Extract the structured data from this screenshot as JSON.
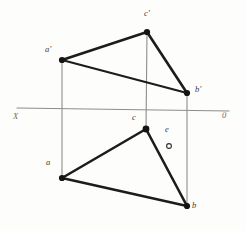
{
  "figure": {
    "background_color": "#fdfdfc",
    "ground_line": {
      "left_label": "X",
      "right_label": "0",
      "color": "#8d8d8b"
    },
    "stroke_colors": {
      "triangle_edge": "#1c1c1c",
      "projector": "#8d8d8b",
      "vertex_fill": "#141414",
      "label_text": "#3b3b3b"
    },
    "vertices": [
      {
        "id": "a-prime",
        "label": "a'",
        "x": 62,
        "y": 60,
        "view": "front",
        "marker": "filled"
      },
      {
        "id": "c-prime",
        "label": "c'",
        "x": 147,
        "y": 32,
        "view": "front",
        "marker": "filled"
      },
      {
        "id": "b-prime",
        "label": "b'",
        "x": 187,
        "y": 93,
        "view": "front",
        "marker": "filled"
      },
      {
        "id": "a",
        "label": "a",
        "x": 62,
        "y": 178,
        "view": "top",
        "marker": "filled"
      },
      {
        "id": "c",
        "label": "c",
        "x": 146,
        "y": 129,
        "view": "top",
        "marker": "filled"
      },
      {
        "id": "b",
        "label": "b",
        "x": 187,
        "y": 206,
        "view": "top",
        "marker": "filled"
      },
      {
        "id": "e",
        "label": "e",
        "x": 169,
        "y": 146,
        "view": "top",
        "marker": "open"
      }
    ],
    "labels": [
      {
        "id": "label-a-prime",
        "text": "a'",
        "x": 45,
        "y": 50
      },
      {
        "id": "label-c-prime",
        "text": "c'",
        "x": 147,
        "y": 14
      },
      {
        "id": "label-b-prime",
        "text": "b'",
        "x": 196,
        "y": 88
      },
      {
        "id": "label-a",
        "text": "a",
        "x": 47,
        "y": 163
      },
      {
        "id": "label-c",
        "text": "c",
        "x": 133,
        "y": 118
      },
      {
        "id": "label-b",
        "text": "b",
        "x": 192,
        "y": 206
      },
      {
        "id": "label-e",
        "text": "e",
        "x": 166,
        "y": 130
      },
      {
        "id": "label-x",
        "text": "X",
        "x": 14,
        "y": 117
      },
      {
        "id": "label-o",
        "text": "0",
        "x": 223,
        "y": 116
      }
    ],
    "edges": [
      {
        "id": "edge-ap-cp",
        "from": "a-prime",
        "to": "c-prime",
        "kind": "triangle"
      },
      {
        "id": "edge-cp-bp",
        "from": "c-prime",
        "to": "b-prime",
        "kind": "triangle"
      },
      {
        "id": "edge-ap-bp",
        "from": "a-prime",
        "to": "b-prime",
        "kind": "triangle"
      },
      {
        "id": "edge-a-c",
        "from": "a",
        "to": "c",
        "kind": "triangle"
      },
      {
        "id": "edge-c-b",
        "from": "c",
        "to": "b",
        "kind": "triangle"
      },
      {
        "id": "edge-a-b",
        "from": "a",
        "to": "b",
        "kind": "triangle"
      },
      {
        "id": "projector-a",
        "from": "a-prime",
        "to": "a",
        "kind": "projector"
      },
      {
        "id": "projector-c",
        "from": "c-prime",
        "to": "c",
        "kind": "projector"
      },
      {
        "id": "projector-b",
        "from": "b-prime",
        "to": "b",
        "kind": "projector"
      }
    ],
    "axis_line": {
      "x1": 17,
      "y1": 108,
      "x2": 229,
      "y2": 111
    }
  }
}
